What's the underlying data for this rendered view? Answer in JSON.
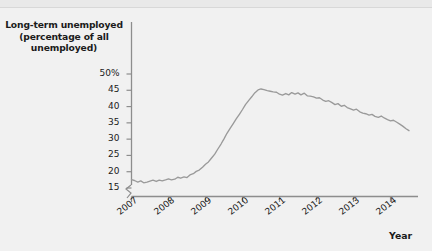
{
  "chart_data": {
    "type": "line",
    "title": "Long-term unemployed (percentage of all unemployed)",
    "title_line1": "Long-term unemployed",
    "title_line2": "(percentage of all",
    "title_line3": "unemployed)",
    "xlabel": "Year",
    "ylabel": "Long-term unemployed (percentage of all unemployed)",
    "ylim": [
      14,
      51
    ],
    "xlim": [
      2007,
      2014.6
    ],
    "grid": false,
    "legend": "none",
    "line_color": "#9a9a9a",
    "y_ticks": [
      15,
      20,
      25,
      30,
      35,
      40,
      45,
      50
    ],
    "y_tick_labels": [
      "15",
      "20",
      "25",
      "30",
      "35",
      "40",
      "45",
      "50%"
    ],
    "x_ticks": [
      2007,
      2008,
      2009,
      2010,
      2011,
      2012,
      2013,
      2014
    ],
    "x_tick_labels": [
      "2007",
      "2008",
      "2009",
      "2010",
      "2011",
      "2012",
      "2013",
      "2014"
    ],
    "y_axis_break": true,
    "series": [
      {
        "name": "Long-term unemployed share",
        "x": [
          2007.0,
          2007.08,
          2007.17,
          2007.25,
          2007.33,
          2007.42,
          2007.5,
          2007.58,
          2007.67,
          2007.75,
          2007.83,
          2007.92,
          2008.0,
          2008.08,
          2008.17,
          2008.25,
          2008.33,
          2008.42,
          2008.5,
          2008.58,
          2008.67,
          2008.75,
          2008.83,
          2008.92,
          2009.0,
          2009.08,
          2009.17,
          2009.25,
          2009.33,
          2009.42,
          2009.5,
          2009.58,
          2009.67,
          2009.75,
          2009.83,
          2009.92,
          2010.0,
          2010.08,
          2010.17,
          2010.25,
          2010.33,
          2010.42,
          2010.5,
          2010.58,
          2010.67,
          2010.75,
          2010.83,
          2010.92,
          2011.0,
          2011.08,
          2011.17,
          2011.25,
          2011.33,
          2011.42,
          2011.5,
          2011.58,
          2011.67,
          2011.75,
          2011.83,
          2011.92,
          2012.0,
          2012.08,
          2012.17,
          2012.25,
          2012.33,
          2012.42,
          2012.5,
          2012.58,
          2012.67,
          2012.75,
          2012.83,
          2012.92,
          2013.0,
          2013.08,
          2013.17,
          2013.25,
          2013.33,
          2013.42,
          2013.5,
          2013.58,
          2013.67,
          2013.75,
          2013.83,
          2013.92,
          2014.0,
          2014.08,
          2014.17,
          2014.25,
          2014.33,
          2014.42,
          2014.5
        ],
        "values": [
          17.6,
          17.3,
          16.8,
          17.2,
          16.6,
          16.8,
          17.1,
          17.4,
          17.0,
          17.4,
          17.2,
          17.5,
          17.8,
          17.5,
          17.7,
          18.3,
          18.0,
          18.4,
          18.2,
          19.0,
          19.4,
          20.1,
          20.5,
          21.4,
          22.3,
          23.0,
          24.3,
          25.4,
          26.9,
          28.5,
          30.1,
          31.8,
          33.4,
          34.8,
          36.2,
          37.7,
          39.1,
          40.6,
          41.9,
          43.0,
          44.2,
          45.1,
          45.4,
          45.2,
          44.9,
          44.7,
          44.5,
          44.4,
          43.8,
          43.5,
          44.0,
          43.6,
          44.3,
          43.8,
          44.2,
          43.6,
          44.1,
          43.3,
          43.2,
          43.0,
          42.6,
          42.7,
          42.0,
          41.6,
          41.8,
          41.2,
          40.6,
          40.9,
          40.1,
          40.4,
          39.7,
          39.3,
          38.9,
          39.2,
          38.4,
          38.0,
          37.8,
          37.4,
          37.6,
          37.0,
          36.7,
          37.1,
          36.5,
          36.0,
          35.6,
          35.8,
          35.2,
          34.6,
          34.0,
          33.2,
          32.6
        ]
      }
    ]
  },
  "chart": {
    "title_lines": [
      "Long-term unemployed",
      "(percentage of all",
      "unemployed)"
    ],
    "x_axis_name": "Year"
  }
}
